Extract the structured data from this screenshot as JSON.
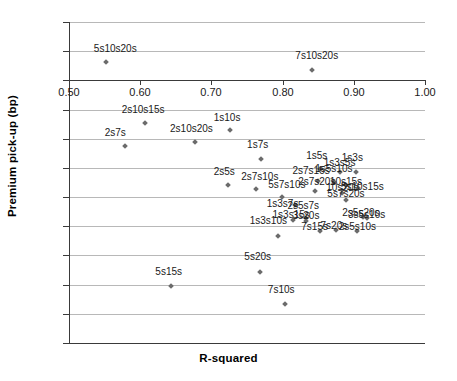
{
  "chart_data": {
    "type": "scatter",
    "title": "",
    "xlabel": "R-squared",
    "ylabel": "Premium pick-up (bp)",
    "xlim": [
      0.5,
      1.0
    ],
    "ylim": [
      -18,
      4
    ],
    "xticks": [
      "0.50",
      "0.60",
      "0.70",
      "0.80",
      "0.90",
      "1.00"
    ],
    "xtick_values": [
      0.5,
      0.6,
      0.7,
      0.8,
      0.9,
      1.0
    ],
    "yticks": [
      "4",
      "2",
      "0",
      "-2",
      "-4",
      "-6",
      "-8",
      "-10",
      "-12",
      "-14",
      "-16",
      "-18"
    ],
    "ytick_values": [
      4,
      2,
      0,
      -2,
      -4,
      -6,
      -8,
      -10,
      -12,
      -14,
      -16,
      -18
    ],
    "grid": true,
    "legend": "none",
    "marker_color": "#6b6b6b",
    "axis_color": "#3a3a3a",
    "grid_color": "#b8b8b8",
    "points": [
      {
        "label": "5s10s20s",
        "x": 0.552,
        "y": 1.25,
        "lx": 0.565,
        "ly": 2.15
      },
      {
        "label": "7s10s20s",
        "x": 0.841,
        "y": 0.7,
        "lx": 0.848,
        "ly": 1.7
      },
      {
        "label": "2s10s15s",
        "x": 0.607,
        "y": -2.9,
        "lx": 0.604,
        "ly": -2.0
      },
      {
        "label": "2s7s",
        "x": 0.579,
        "y": -4.5,
        "lx": 0.565,
        "ly": -3.6
      },
      {
        "label": "2s10s20s",
        "x": 0.677,
        "y": -4.2,
        "lx": 0.672,
        "ly": -3.35
      },
      {
        "label": "1s10s",
        "x": 0.726,
        "y": -3.4,
        "lx": 0.722,
        "ly": -2.55
      },
      {
        "label": "1s7s",
        "x": 0.77,
        "y": -5.4,
        "lx": 0.765,
        "ly": -4.45
      },
      {
        "label": "2s5s",
        "x": 0.723,
        "y": -7.2,
        "lx": 0.718,
        "ly": -6.25
      },
      {
        "label": "2s7s10s",
        "x": 0.763,
        "y": -7.45,
        "lx": 0.768,
        "ly": -6.6
      },
      {
        "label": "5s7s10s",
        "x": 0.799,
        "y": -8.0,
        "lx": 0.806,
        "ly": -7.15
      },
      {
        "label": "1s3s7s",
        "x": 0.818,
        "y": -8.55,
        "lx": 0.8,
        "ly": -8.45
      },
      {
        "label": "1s3s10s",
        "x": 0.793,
        "y": -10.7,
        "lx": 0.78,
        "ly": -9.65
      },
      {
        "label": "1s5s",
        "x": 0.853,
        "y": -6.1,
        "lx": 0.848,
        "ly": -5.2
      },
      {
        "label": "1s3s",
        "x": 0.903,
        "y": -6.25,
        "lx": 0.898,
        "ly": -5.3
      },
      {
        "label": "1s3s5s",
        "x": 0.88,
        "y": -6.3,
        "lx": 0.88,
        "ly": -5.65
      },
      {
        "label": "2s7s15s",
        "x": 0.85,
        "y": -6.9,
        "lx": 0.84,
        "ly": -6.2
      },
      {
        "label": "1s5s10s",
        "x": 0.872,
        "y": -6.95,
        "lx": 0.872,
        "ly": -6.05
      },
      {
        "label": "2s7s20s",
        "x": 0.846,
        "y": -7.6,
        "lx": 0.848,
        "ly": -6.95
      },
      {
        "label": "10s15s",
        "x": 0.889,
        "y": -7.2,
        "lx": 0.889,
        "ly": -6.95
      },
      {
        "label": "10s20s",
        "x": 0.884,
        "y": -7.7,
        "lx": 0.884,
        "ly": -7.35
      },
      {
        "label": "5s10s15s",
        "x": 0.906,
        "y": -7.35,
        "lx": 0.912,
        "ly": -7.3
      },
      {
        "label": "5s7s20s",
        "x": 0.889,
        "y": -8.2,
        "lx": 0.889,
        "ly": -7.8
      },
      {
        "label": "2s5s7s",
        "x": 0.833,
        "y": -9.45,
        "lx": 0.829,
        "ly": -8.6
      },
      {
        "label": "1s3s15s",
        "x": 0.815,
        "y": -9.6,
        "lx": 0.812,
        "ly": -9.25
      },
      {
        "label": "3s20s",
        "x": 0.833,
        "y": -9.65,
        "lx": 0.833,
        "ly": -9.3
      },
      {
        "label": "2s5s20s",
        "x": 0.913,
        "y": -9.35,
        "lx": 0.91,
        "ly": -9.1
      },
      {
        "label": "3s5s10s",
        "x": 0.918,
        "y": -9.4,
        "lx": 0.918,
        "ly": -9.2
      },
      {
        "label": "7s15s",
        "x": 0.852,
        "y": -10.35,
        "lx": 0.845,
        "ly": -10.05
      },
      {
        "label": "7s20s",
        "x": 0.875,
        "y": -10.25,
        "lx": 0.872,
        "ly": -10.0
      },
      {
        "label": "2s5s10s",
        "x": 0.905,
        "y": -10.3,
        "lx": 0.905,
        "ly": -10.05
      },
      {
        "label": "5s15s",
        "x": 0.643,
        "y": -14.1,
        "lx": 0.64,
        "ly": -13.1
      },
      {
        "label": "5s20s",
        "x": 0.768,
        "y": -13.1,
        "lx": 0.765,
        "ly": -12.1
      },
      {
        "label": "7s10s",
        "x": 0.803,
        "y": -15.3,
        "lx": 0.798,
        "ly": -14.35
      }
    ]
  }
}
